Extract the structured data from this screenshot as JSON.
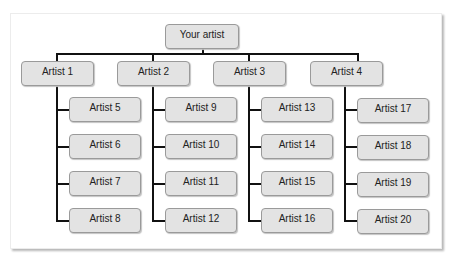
{
  "diagram": {
    "root": {
      "label": "Your artist"
    },
    "branches": [
      {
        "label": "Artist 1",
        "children": [
          "Artist 5",
          "Artist 6",
          "Artist 7",
          "Artist 8"
        ]
      },
      {
        "label": "Artist 2",
        "children": [
          "Artist 9",
          "Artist 10",
          "Artist 11",
          "Artist 12"
        ]
      },
      {
        "label": "Artist 3",
        "children": [
          "Artist 13",
          "Artist 14",
          "Artist 15",
          "Artist 16"
        ]
      },
      {
        "label": "Artist 4",
        "children": [
          "Artist 17",
          "Artist 18",
          "Artist 19",
          "Artist 20"
        ]
      }
    ],
    "colors": {
      "node_fill": "#e3e3e3",
      "node_border": "#9a9a9a",
      "connector": "#111111"
    }
  }
}
